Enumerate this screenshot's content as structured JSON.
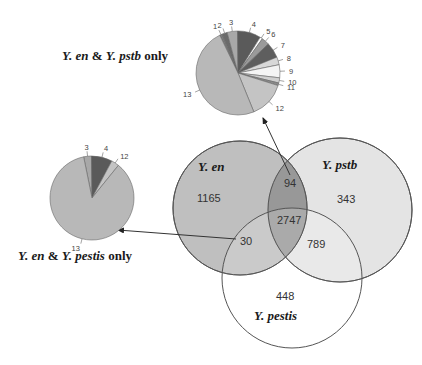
{
  "chart_data": [
    {
      "type": "venn",
      "title": "",
      "sets": [
        "Y. en",
        "Y. pstb",
        "Y. pestis"
      ],
      "regions": {
        "en_only": 1165,
        "pstb_only": 343,
        "pestis_only": 448,
        "en_pstb_only": 94,
        "en_pestis_only": 30,
        "pstb_pestis_only": 789,
        "all_three": 2747
      }
    },
    {
      "type": "pie",
      "title": "Y. en & Y. pstb only",
      "categories": [
        "1",
        "2",
        "3",
        "4",
        "5",
        "6",
        "7",
        "8",
        "9",
        "10",
        "11",
        "12",
        "13"
      ],
      "values": [
        1,
        2,
        4,
        9,
        1,
        3,
        6,
        3,
        5,
        2,
        1,
        14,
        49
      ],
      "source_region": "94"
    },
    {
      "type": "pie",
      "title": "Y. en & Y. pestis only",
      "categories": [
        "3",
        "4",
        "12",
        "13"
      ],
      "values": [
        3,
        8,
        3,
        86
      ],
      "source_region": "30"
    }
  ],
  "labels": {
    "set_en": "Y. en",
    "set_pstb": "Y. pstb",
    "set_pestis": "Y. pestis",
    "pie_top_title_a": "Y. en",
    "pie_top_title_amp": " & ",
    "pie_top_title_b": "Y. pstb",
    "pie_top_title_c": " only",
    "pie_left_title_a": "Y. en",
    "pie_left_title_amp": " & ",
    "pie_left_title_b": "Y. pestis",
    "pie_left_title_c": " only"
  },
  "numbers": {
    "en_only": "1165",
    "pstb_only": "343",
    "pestis_only": "448",
    "en_pstb": "94",
    "en_pestis": "30",
    "pstb_pestis": "789",
    "all": "2747"
  },
  "pie_top_labels": [
    "1",
    "2",
    "3",
    "4",
    "5",
    "6",
    "7",
    "8",
    "9",
    "10",
    "11",
    "12",
    "13"
  ],
  "pie_left_labels": [
    "3",
    "4",
    "12",
    "13"
  ]
}
